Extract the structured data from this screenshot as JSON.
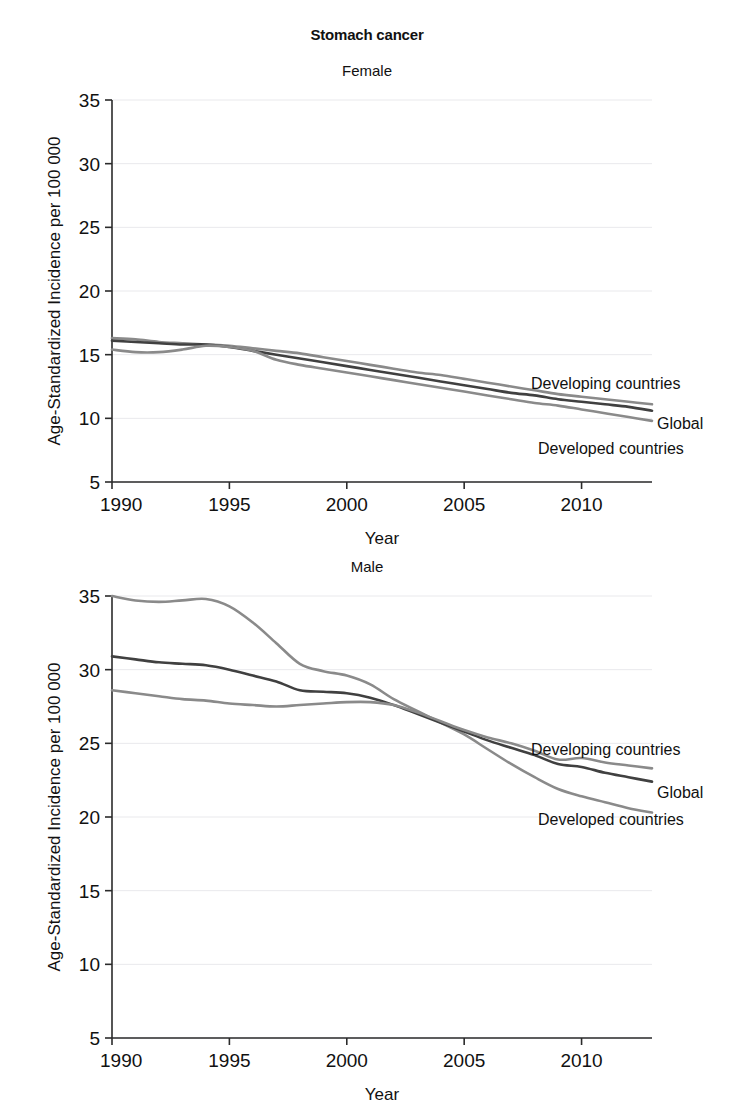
{
  "figure": {
    "title": "Stomach cancer",
    "axis_labels": {
      "x": "Year",
      "y": "Age-Standardized Incidence per 100 000"
    },
    "colors": {
      "global": "#404040",
      "developing": "#8a8a8a",
      "developed": "#8a8a8a",
      "grid": "#e9e9ec",
      "axis": "#2b2b2b",
      "text": "#111111",
      "background": "#ffffff"
    }
  },
  "chart_data": [
    {
      "type": "line",
      "panel": "female",
      "title": "Female",
      "subtitle": "Female",
      "xlabel": "Year",
      "ylabel": "Age-Standardized Incidence per 100 000",
      "xlim": [
        1990,
        2013
      ],
      "ylim": [
        5,
        35
      ],
      "xticks": [
        1990,
        1995,
        2000,
        2005,
        2010
      ],
      "yticks": [
        5,
        10,
        15,
        20,
        25,
        30,
        35
      ],
      "grid": true,
      "legend_position": "inline-right",
      "x": [
        1990,
        1991,
        1992,
        1993,
        1994,
        1995,
        1996,
        1997,
        1998,
        1999,
        2000,
        2001,
        2002,
        2003,
        2004,
        2005,
        2006,
        2007,
        2008,
        2009,
        2010,
        2011,
        2012,
        2013
      ],
      "series": [
        {
          "name": "Developing countries",
          "color": "#8a8a8a",
          "label": "Developing countries",
          "values": [
            16.3,
            16.2,
            16.0,
            15.9,
            15.8,
            15.7,
            15.5,
            15.3,
            15.1,
            14.8,
            14.5,
            14.2,
            13.9,
            13.6,
            13.4,
            13.1,
            12.8,
            12.5,
            12.2,
            11.9,
            11.7,
            11.5,
            11.3,
            11.1
          ]
        },
        {
          "name": "Global",
          "color": "#404040",
          "label": "Global",
          "values": [
            16.1,
            16.0,
            15.9,
            15.8,
            15.8,
            15.6,
            15.3,
            15.0,
            14.7,
            14.4,
            14.1,
            13.8,
            13.5,
            13.2,
            12.9,
            12.6,
            12.3,
            12.0,
            11.8,
            11.5,
            11.3,
            11.1,
            10.9,
            10.6
          ]
        },
        {
          "name": "Developed countries",
          "color": "#8a8a8a",
          "label": "Developed countries",
          "values": [
            15.4,
            15.2,
            15.2,
            15.4,
            15.7,
            15.6,
            15.3,
            14.6,
            14.2,
            13.9,
            13.6,
            13.3,
            13.0,
            12.7,
            12.4,
            12.1,
            11.8,
            11.5,
            11.2,
            11.0,
            10.7,
            10.4,
            10.1,
            9.8
          ]
        }
      ]
    },
    {
      "type": "line",
      "panel": "male",
      "title": "Male",
      "subtitle": "Male",
      "xlabel": "Year",
      "ylabel": "Age-Standardized Incidence per 100 000",
      "xlim": [
        1990,
        2013
      ],
      "ylim": [
        5,
        35
      ],
      "xticks": [
        1990,
        1995,
        2000,
        2005,
        2010
      ],
      "yticks": [
        5,
        10,
        15,
        20,
        25,
        30,
        35
      ],
      "grid": true,
      "legend_position": "inline-right",
      "x": [
        1990,
        1991,
        1992,
        1993,
        1994,
        1995,
        1996,
        1997,
        1998,
        1999,
        2000,
        2001,
        2002,
        2003,
        2004,
        2005,
        2006,
        2007,
        2008,
        2009,
        2010,
        2011,
        2012,
        2013
      ],
      "series": [
        {
          "name": "Developed countries",
          "color": "#8a8a8a",
          "label": "Developed countries",
          "values": [
            35.0,
            34.7,
            34.6,
            34.7,
            34.8,
            34.3,
            33.2,
            31.8,
            30.4,
            29.9,
            29.6,
            29.0,
            28.0,
            27.2,
            26.4,
            25.6,
            24.6,
            23.6,
            22.7,
            21.9,
            21.4,
            21.0,
            20.6,
            20.3
          ]
        },
        {
          "name": "Global",
          "color": "#404040",
          "label": "Global",
          "values": [
            30.9,
            30.7,
            30.5,
            30.4,
            30.3,
            30.0,
            29.6,
            29.2,
            28.6,
            28.5,
            28.4,
            28.1,
            27.6,
            27.0,
            26.4,
            25.8,
            25.2,
            24.7,
            24.2,
            23.6,
            23.4,
            23.0,
            22.7,
            22.4
          ]
        },
        {
          "name": "Developing countries",
          "color": "#8a8a8a",
          "label": "Developing countries",
          "values": [
            28.6,
            28.4,
            28.2,
            28.0,
            27.9,
            27.7,
            27.6,
            27.5,
            27.6,
            27.7,
            27.8,
            27.8,
            27.6,
            27.1,
            26.5,
            25.9,
            25.4,
            25.0,
            24.5,
            23.9,
            24.0,
            23.7,
            23.5,
            23.3
          ]
        }
      ]
    }
  ]
}
